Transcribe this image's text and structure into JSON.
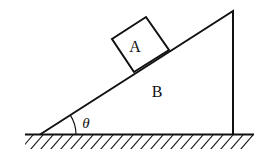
{
  "diagram": {
    "type": "physics-incline",
    "labels": {
      "block": "A",
      "wedge": "B",
      "angle": "θ"
    },
    "colors": {
      "stroke": "#111111",
      "background": "#ffffff"
    }
  }
}
